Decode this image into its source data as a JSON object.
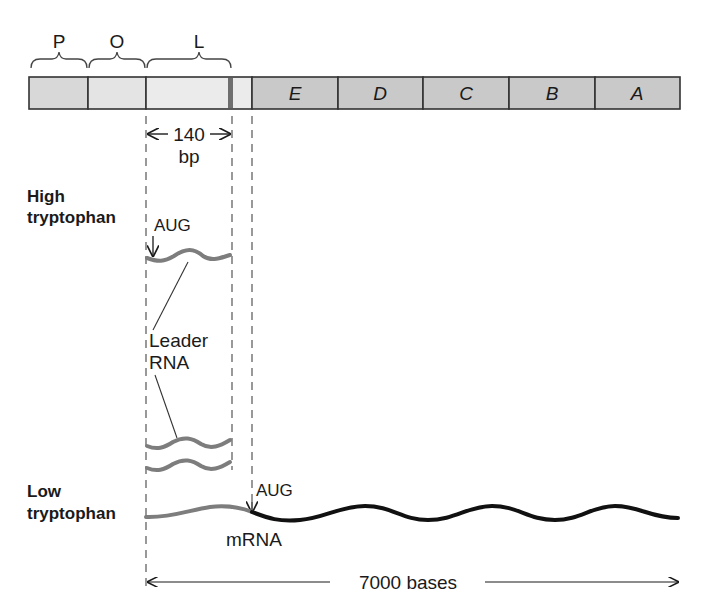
{
  "diagram": {
    "regions": [
      {
        "label": "P",
        "x1": 29,
        "x2": 88
      },
      {
        "label": "O",
        "x1": 88,
        "x2": 146
      },
      {
        "label": "L",
        "x1": 146,
        "x2": 252
      }
    ],
    "genes": [
      {
        "label": "E",
        "x1": 252,
        "x2": 338
      },
      {
        "label": "D",
        "x1": 338,
        "x2": 423
      },
      {
        "label": "C",
        "x1": 423,
        "x2": 509
      },
      {
        "label": "B",
        "x1": 509,
        "x2": 595
      },
      {
        "label": "A",
        "x1": 595,
        "x2": 680
      }
    ],
    "colors": {
      "bar_light": "#e6e6e6",
      "bar_gene": "#c9c9c9",
      "attenuator_marker": "#6e6e6e",
      "leader_rna": "#7d7d7d",
      "mrna": "#111111",
      "dash": "#555555"
    },
    "leader_length": {
      "value": "140",
      "unit": "bp"
    },
    "high_tryptophan": {
      "label_line1": "High",
      "label_line2": "tryptophan",
      "start_codon": "AUG",
      "leader_label_line1": "Leader",
      "leader_label_line2": "RNA"
    },
    "low_tryptophan": {
      "label_line1": "Low",
      "label_line2": "tryptophan",
      "start_codon": "AUG",
      "mrna_label": "mRNA"
    },
    "transcript_length": "7000 bases"
  }
}
